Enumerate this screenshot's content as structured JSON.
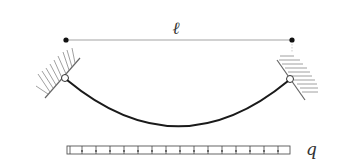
{
  "diagram": {
    "span_label": "ℓ",
    "load_label": "q",
    "colors": {
      "cable": "#1a1a1a",
      "dimension_line": "#888888",
      "hatch": "#777777",
      "load_bar": "#555555",
      "background": "#ffffff"
    },
    "elements": {
      "span_dimension": {
        "from_x": 66,
        "to_x": 292,
        "y": 40
      },
      "left_support": {
        "hinge_x": 65,
        "hinge_y": 78,
        "type": "inclined-wall-hinge"
      },
      "right_support": {
        "hinge_x": 290,
        "hinge_y": 79,
        "type": "inclined-wall-hinge"
      },
      "cable": {
        "sag_bottom_x": 178,
        "sag_bottom_y": 126
      },
      "distributed_load": {
        "from_x": 67,
        "to_x": 290,
        "y": 150,
        "arrow_count": 15
      }
    }
  }
}
